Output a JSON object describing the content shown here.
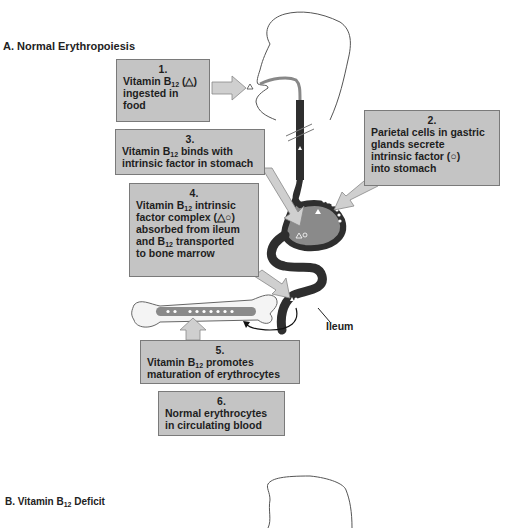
{
  "section_a": {
    "title": "A. Normal Erythropoiesis",
    "steps": [
      {
        "num": "1.",
        "lines": [
          "Vitamin B",
          "12",
          " (△)",
          "ingested in",
          "food"
        ]
      },
      {
        "num": "2.",
        "lines": [
          "Parietal cells in gastric",
          "glands secrete",
          "intrinsic factor (○)",
          "into stomach"
        ]
      },
      {
        "num": "3.",
        "lines": [
          "Vitamin B",
          "12",
          " binds with",
          "intrinsic factor in stomach"
        ]
      },
      {
        "num": "4.",
        "lines": [
          "Vitamin B",
          "12",
          " intrinsic",
          "factor complex (△○)",
          "absorbed from ileum",
          "and B",
          "12",
          " transported",
          "to bone marrow"
        ]
      },
      {
        "num": "5.",
        "lines": [
          "Vitamin B",
          "12",
          " promotes",
          "maturation of erythrocytes"
        ]
      },
      {
        "num": "6.",
        "lines": [
          "Normal erythrocytes",
          "in circulating blood"
        ]
      }
    ],
    "ileum_label": "Ileum"
  },
  "section_b": {
    "title_prefix": "B. Vitamin B",
    "title_sub": "12",
    "title_suffix": " Deficit"
  },
  "colors": {
    "box_fill": "#c4c4c4",
    "box_border": "#7a7a7a",
    "gut_dark": "#2e2e2e",
    "stomach_fill": "#8a8a8a",
    "arrow_fill": "#cfcfcf"
  }
}
